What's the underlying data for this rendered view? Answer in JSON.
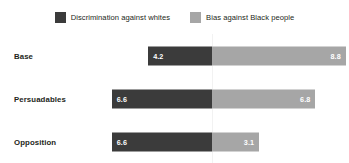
{
  "legend": {
    "items": [
      {
        "label": "Discrimination against whites",
        "color": "#3b3b3b",
        "swatch_name": "legend-swatch-discrimination"
      },
      {
        "label": "Bias against Black people",
        "color": "#a6a6a6",
        "swatch_name": "legend-swatch-bias"
      }
    ]
  },
  "chart_data": {
    "type": "bar",
    "orientation": "horizontal",
    "layout": "diverging",
    "title": "",
    "subtitle": "",
    "xlabel": "",
    "ylabel": "",
    "grid": false,
    "legend_position": "top-center",
    "categories": [
      "Base",
      "Persuadables",
      "Opposition"
    ],
    "series": [
      {
        "name": "Discrimination against whites",
        "color": "#3b3b3b",
        "direction": "left",
        "values": [
          4.2,
          6.6,
          6.6
        ],
        "labels": [
          "4.2",
          "6.6",
          "6.6"
        ]
      },
      {
        "name": "Bias against Black people",
        "color": "#a6a6a6",
        "direction": "right",
        "values": [
          8.8,
          6.8,
          3.1
        ],
        "labels": [
          "8.8",
          "6.8",
          "3.1"
        ]
      }
    ],
    "xlim": [
      -10,
      10
    ],
    "axis_ticks": [],
    "annotations": []
  },
  "colors": {
    "dark_bar": "#3b3b3b",
    "light_bar": "#a6a6a6",
    "value_text": "#ffffff",
    "label_text": "#231f20",
    "background": "#ffffff",
    "divider": "#f2f2f2"
  },
  "scale": {
    "px_per_unit": 15.2
  }
}
